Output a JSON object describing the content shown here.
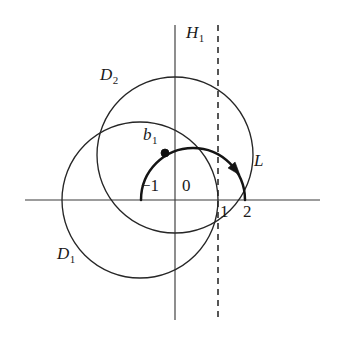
{
  "figure": {
    "background_color": "#ffffff",
    "stroke_color": "#262626",
    "accent_color": "#141414"
  },
  "axes": {
    "x_axis": {
      "name": "real-axis",
      "y": 200,
      "x_start": 25,
      "x_end": 320
    },
    "y_axis": {
      "name": "imaginary-axis",
      "x": 175,
      "y_start": 25,
      "y_end": 320
    },
    "origin": {
      "x": 175,
      "y": 200
    },
    "unit_px": 43
  },
  "dashed_line": {
    "label": "H",
    "subscript": "1",
    "x": 218,
    "y_start": 25,
    "y_end": 320,
    "label_x": 186,
    "label_y": 24
  },
  "circles": [
    {
      "label": "D",
      "subscript": "1",
      "cx": 140,
      "cy": 200,
      "r": 78,
      "label_x": 57,
      "label_y": 245
    },
    {
      "label": "D",
      "subscript": "2",
      "cx": 175,
      "cy": 155,
      "r": 78,
      "label_x": 100,
      "label_y": 66
    }
  ],
  "arc": {
    "label": "L",
    "cx": 193,
    "cy": 200,
    "r": 52,
    "start_x": 141,
    "start_y": 200,
    "end_x": 245,
    "end_y": 200,
    "label_x": 254,
    "label_y": 152,
    "orientation": "clockwise-over-top"
  },
  "points": [
    {
      "label": "b",
      "subscript": "1",
      "x": 165,
      "y": 153,
      "radius": 4,
      "label_x": 143,
      "label_y": 126
    }
  ],
  "tick_labels": [
    {
      "text": "−1",
      "x": 141,
      "y": 177,
      "anchor": "left"
    },
    {
      "text": "0",
      "x": 182,
      "y": 177,
      "anchor": "left"
    },
    {
      "text": "1",
      "x": 220,
      "y": 203,
      "anchor": "left"
    },
    {
      "text": "2",
      "x": 243,
      "y": 203,
      "anchor": "left"
    }
  ]
}
